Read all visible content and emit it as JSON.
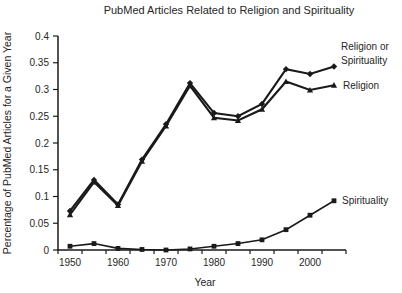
{
  "chart_data": {
    "type": "line",
    "title": "PubMed Articles Related to Religion and Spirituality",
    "xlabel": "Year",
    "ylabel": "Percentage of PubMed Articles for a Given Year",
    "x": [
      1950,
      1955,
      1960,
      1965,
      1970,
      1975,
      1980,
      1985,
      1990,
      1995,
      2000,
      2005
    ],
    "x_tick_labels": [
      "1950",
      "1960",
      "1970",
      "1980",
      "1990",
      "2000"
    ],
    "y_ticks": [
      0,
      0.05,
      0.1,
      0.15,
      0.2,
      0.25,
      0.3,
      0.35,
      0.4
    ],
    "y_tick_labels": [
      "0",
      "0.05",
      "0.1",
      "0.15",
      "0.2",
      "0.25",
      "0.3",
      "0.35",
      "0.4"
    ],
    "ylim": [
      0,
      0.4
    ],
    "xlim_years": [
      1950,
      2005
    ],
    "grid": false,
    "legend_position": "inline-right-of-lines",
    "line_color": "#1a1a1a",
    "text_color": "#262626",
    "background_color": "#ffffff",
    "series": [
      {
        "name": "Religion or Spirituality",
        "label_lines": [
          "Religion or",
          "Spirituality"
        ],
        "marker": "diamond",
        "label_offset": {
          "dx": 7,
          "dy": [
            -16,
            -2
          ]
        },
        "values": [
          0.073,
          0.131,
          0.085,
          0.169,
          0.235,
          0.312,
          0.256,
          0.25,
          0.273,
          0.338,
          0.329,
          0.343
        ]
      },
      {
        "name": "Religion",
        "label_lines": [
          "Religion"
        ],
        "marker": "triangle",
        "label_offset": {
          "dx": 9,
          "dy": [
            3.5
          ]
        },
        "values": [
          0.066,
          0.127,
          0.083,
          0.166,
          0.232,
          0.307,
          0.247,
          0.242,
          0.263,
          0.315,
          0.299,
          0.308
        ]
      },
      {
        "name": "Spirituality",
        "label_lines": [
          "Spirituality"
        ],
        "marker": "square",
        "label_offset": {
          "dx": 8,
          "dy": [
            3.5
          ]
        },
        "values": [
          0.007,
          0.012,
          0.003,
          0.001,
          0.0,
          0.002,
          0.007,
          0.012,
          0.019,
          0.038,
          0.065,
          0.092
        ]
      }
    ]
  }
}
